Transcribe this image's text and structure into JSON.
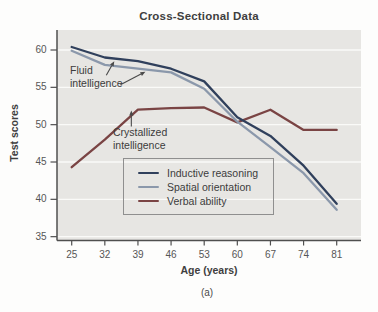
{
  "figure": {
    "title": "Cross-Sectional Data",
    "x_axis_label": "Age (years)",
    "y_axis_label": "Test scores",
    "caption": "(a)"
  },
  "chart_data": {
    "type": "line",
    "title": "Cross-Sectional Data",
    "xlabel": "Age (years)",
    "ylabel": "Test scores",
    "x": [
      25,
      32,
      39,
      46,
      53,
      60,
      67,
      74,
      81
    ],
    "y_ticks": [
      35,
      40,
      45,
      50,
      55,
      60
    ],
    "ylim": [
      34.5,
      62.5
    ],
    "grid": "horizontal-white-gridlines-on-gray-panel",
    "legend_position": "inside-lower-center",
    "series": [
      {
        "name": "Inductive reasoning",
        "color": "#30405c",
        "values": [
          60.4,
          59.0,
          58.5,
          57.5,
          55.8,
          51.0,
          48.5,
          44.5,
          39.4
        ]
      },
      {
        "name": "Spatial orientation",
        "color": "#8b98ab",
        "values": [
          59.9,
          58.0,
          57.5,
          57.0,
          54.8,
          50.4,
          47.0,
          43.5,
          38.6
        ]
      },
      {
        "name": "Verbal ability",
        "color": "#7a4444",
        "values": [
          44.3,
          48.0,
          52.0,
          52.2,
          52.3,
          50.3,
          52.0,
          49.3,
          49.3
        ]
      }
    ],
    "annotations": [
      {
        "text": "Fluid intelligence",
        "targets": [
          {
            "age": 34,
            "score": 58.9
          },
          {
            "age": 41,
            "score": 57.35
          }
        ]
      },
      {
        "text": "Crystallized intelligence",
        "targets": [
          {
            "age": 37.6,
            "score": 51.5
          }
        ]
      }
    ],
    "colors": {
      "panel_background": "#e7e6e3",
      "gridline": "#fafaf8",
      "axis": "#4f4f4f",
      "tick_label": "#565656",
      "annotation_arrow": "#4a4a4a"
    }
  }
}
